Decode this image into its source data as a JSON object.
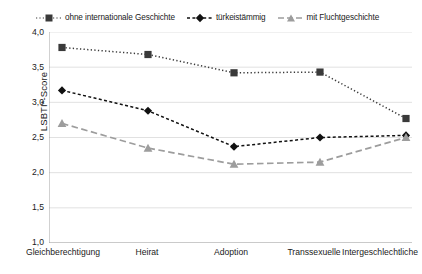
{
  "chart_data": {
    "type": "line",
    "title": "",
    "subtitle": "",
    "xlabel": "",
    "ylabel": "LSBTI*-Score",
    "ylim": [
      1.0,
      4.0
    ],
    "ytick_labels": [
      "4,0",
      "3,5",
      "3,0",
      "2,5",
      "2,0",
      "1,5",
      "1,0"
    ],
    "ytick_values": [
      4.0,
      3.5,
      3.0,
      2.5,
      2.0,
      1.5,
      1.0
    ],
    "grid": true,
    "legend_position": "top",
    "categories": [
      "Gleichberechtigung",
      "Heirat",
      "Adoption",
      "Transsexuelle",
      "Intergeschlechtliche"
    ],
    "series": [
      {
        "name": "ohne internationale Geschichte",
        "values": [
          3.78,
          3.68,
          3.42,
          3.43,
          2.77
        ],
        "color": "#3a3a3a",
        "marker": "square",
        "linestyle": "dotted"
      },
      {
        "name": "türkeistämmig",
        "values": [
          3.17,
          2.88,
          2.37,
          2.5,
          2.53
        ],
        "color": "#111111",
        "marker": "diamond",
        "linestyle": "dashed-dotted"
      },
      {
        "name": "mit Fluchtgeschichte",
        "values": [
          2.7,
          2.35,
          2.12,
          2.15,
          2.5
        ],
        "color": "#9d9d9d",
        "marker": "triangle",
        "linestyle": "dashed"
      }
    ]
  },
  "legend": {
    "entries": [
      {
        "label": "ohne internationale Geschichte"
      },
      {
        "label": "türkeistämmig"
      },
      {
        "label": "mit Fluchtgeschichte"
      }
    ]
  },
  "axes": {
    "y_title": "LSBTI*-Score"
  },
  "colors": {
    "series_1": "#3a3a3a",
    "series_2": "#111111",
    "series_3": "#9d9d9d",
    "grid": "#d9d9d9",
    "axis": "#9a9a9a",
    "background": "#ffffff"
  }
}
